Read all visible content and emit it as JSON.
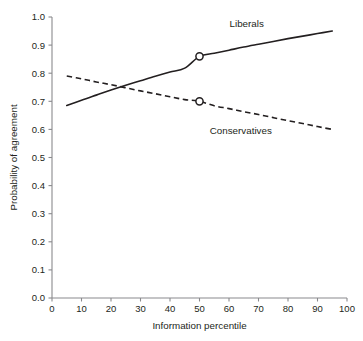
{
  "chart_data": {
    "type": "line",
    "title": "",
    "xlabel": "Information percentile",
    "ylabel": "Probability of agreement",
    "xlim": [
      0,
      100
    ],
    "ylim": [
      0.0,
      1.0
    ],
    "grid": false,
    "legend_position": "inline-annotations",
    "xticks": [
      0,
      10,
      20,
      30,
      40,
      50,
      60,
      70,
      80,
      90,
      100
    ],
    "xtick_labels": [
      "0",
      "10",
      "20",
      "30",
      "40",
      "50",
      "60",
      "70",
      "80",
      "90",
      "100"
    ],
    "yticks": [
      0.0,
      0.1,
      0.2,
      0.3,
      0.4,
      0.5,
      0.6,
      0.7,
      0.8,
      0.9,
      1.0
    ],
    "ytick_labels": [
      "0.0",
      "0.1",
      "0.2",
      "0.3",
      "0.4",
      "0.5",
      "0.6",
      "0.7",
      "0.8",
      "0.9",
      "1.0"
    ],
    "series": [
      {
        "name": "Liberals",
        "style": "solid",
        "color": "#231f20",
        "x": [
          5,
          10,
          15,
          20,
          25,
          30,
          35,
          40,
          45,
          50,
          55,
          60,
          65,
          70,
          75,
          80,
          85,
          90,
          95
        ],
        "values": [
          0.685,
          0.704,
          0.722,
          0.74,
          0.757,
          0.773,
          0.789,
          0.804,
          0.818,
          0.86,
          0.871,
          0.882,
          0.893,
          0.903,
          0.913,
          0.923,
          0.932,
          0.941,
          0.95
        ],
        "marker_points": [
          {
            "x": 50,
            "y": 0.86
          }
        ],
        "label_text": "Liberals",
        "label_x": 66,
        "label_y": 0.965
      },
      {
        "name": "Conservatives",
        "style": "dashed",
        "color": "#231f20",
        "x": [
          5,
          10,
          15,
          20,
          25,
          30,
          35,
          40,
          45,
          50,
          55,
          60,
          65,
          70,
          75,
          80,
          85,
          90,
          95
        ],
        "values": [
          0.79,
          0.78,
          0.769,
          0.759,
          0.748,
          0.737,
          0.727,
          0.716,
          0.706,
          0.7,
          0.684,
          0.674,
          0.663,
          0.653,
          0.642,
          0.631,
          0.621,
          0.61,
          0.6
        ],
        "marker_points": [
          {
            "x": 50,
            "y": 0.7
          }
        ],
        "label_text": "Conservatives",
        "label_x": 64,
        "label_y": 0.585
      }
    ],
    "annotations": [
      {
        "text": "Liberals",
        "x": 66,
        "y": 0.965
      },
      {
        "text": "Conservatives",
        "x": 64,
        "y": 0.585
      }
    ],
    "intersection": {
      "x": 21,
      "y": 0.755
    }
  },
  "axes": {
    "x_title": "Information percentile",
    "y_title": "Probability of agreement"
  },
  "colors": {
    "line": "#231f20",
    "axis": "#8a8a8d",
    "background": "#ffffff",
    "marker_fill": "#ffffff"
  }
}
